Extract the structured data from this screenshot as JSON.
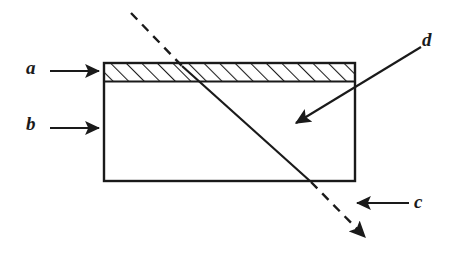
{
  "figure": {
    "type": "cross-section-schematic",
    "background_color": "#ffffff",
    "line_color": "#1a1a1a"
  },
  "labels": {
    "a": "a",
    "b": "b",
    "c": "c",
    "d": "d"
  },
  "callouts": [
    {
      "id": "a",
      "label": "a",
      "direction": "right",
      "label_x": 26,
      "label_y": 58,
      "arrow_from": [
        50,
        71
      ],
      "arrow_to": [
        100,
        71
      ],
      "points_at": "hatched-top-layer"
    },
    {
      "id": "b",
      "label": "b",
      "direction": "right",
      "label_x": 26,
      "label_y": 114,
      "arrow_from": [
        50,
        128
      ],
      "arrow_to": [
        100,
        128
      ],
      "points_at": "slab-body"
    },
    {
      "id": "c",
      "label": "c",
      "direction": "left",
      "label_x": 414,
      "label_y": 192,
      "arrow_from": [
        408,
        203
      ],
      "arrow_to": [
        354,
        203
      ],
      "points_at": "dashed-oblique-line-lower"
    },
    {
      "id": "d",
      "label": "d",
      "direction": "down-left",
      "label_x": 422,
      "label_y": 30,
      "arrow_from": [
        421,
        47
      ],
      "arrow_to": [
        293,
        125
      ],
      "points_at": "solid-oblique-line-interior"
    }
  ],
  "shapes": {
    "slab": {
      "name": "slab-outline",
      "x": 104,
      "y": 63,
      "width": 251,
      "height": 118,
      "stroke_width": 2,
      "fill": "none"
    },
    "hatched_layer": {
      "name": "hatched-top-layer",
      "x": 104,
      "y": 63,
      "width": 251,
      "height": 19,
      "hatch_angle_deg": 45,
      "hatch_spacing_px": 11,
      "hatch_direction": "bottom-left-to-top-right"
    }
  },
  "oblique_line": {
    "name": "oblique-ray",
    "segments": [
      {
        "style": "dashed",
        "from": [
          131,
          13
        ],
        "to": [
          182,
          66
        ]
      },
      {
        "style": "solid",
        "from": [
          182,
          66
        ],
        "to": [
          310,
          181
        ]
      },
      {
        "style": "dashed",
        "from": [
          310,
          181
        ],
        "to": [
          366,
          238
        ]
      }
    ],
    "terminator": "arrowhead",
    "terminator_at": [
      370,
      243
    ],
    "dash_pattern": "9 7"
  }
}
